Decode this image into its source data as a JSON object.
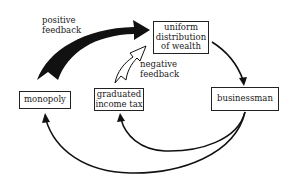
{
  "diagram": {
    "nodes": [
      {
        "id": "monopoly",
        "label": "monopoly"
      },
      {
        "id": "income_tax",
        "label": "graduated income tax",
        "lines": [
          "graduated",
          "income tax"
        ]
      },
      {
        "id": "uniform",
        "label": "uniform distribution of wealth",
        "lines": [
          "uniform",
          "distribution",
          "of wealth"
        ]
      },
      {
        "id": "businessman",
        "label": "businessman"
      }
    ],
    "edges": [
      {
        "from": "monopoly",
        "to": "uniform",
        "style": "thick-black",
        "label": "positive feedback"
      },
      {
        "from": "income_tax",
        "to": "uniform",
        "style": "hollow",
        "label": "negative feedback"
      },
      {
        "from": "uniform",
        "to": "businessman",
        "style": "thin"
      },
      {
        "from": "businessman",
        "to": "income_tax",
        "style": "thin"
      },
      {
        "from": "businessman",
        "to": "monopoly",
        "style": "thin"
      }
    ],
    "labels": {
      "positive": [
        "positive",
        "feedback"
      ],
      "negative": [
        "negative",
        "feedback"
      ]
    }
  }
}
